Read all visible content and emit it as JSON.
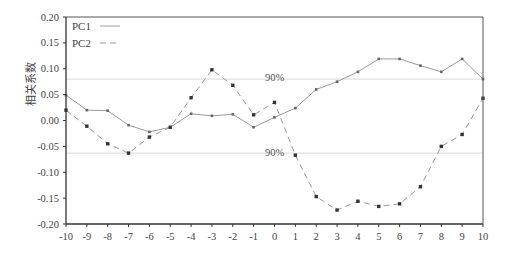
{
  "chart_data": {
    "type": "line",
    "title": "",
    "xlabel": "",
    "ylabel": "相关系数",
    "xlim": [
      -10,
      10
    ],
    "ylim": [
      -0.2,
      0.2
    ],
    "x": [
      -10,
      -9,
      -8,
      -7,
      -6,
      -5,
      -4,
      -3,
      -2,
      -1,
      0,
      1,
      2,
      3,
      4,
      5,
      6,
      7,
      8,
      9,
      10
    ],
    "x_ticks": [
      "-10",
      "-9",
      "-8",
      "-7",
      "-6",
      "-5",
      "-4",
      "-3",
      "-2",
      "-1",
      "0",
      "1",
      "2",
      "3",
      "4",
      "5",
      "6",
      "7",
      "8",
      "9",
      "10"
    ],
    "y_ticks": [
      "0.20",
      "0.15",
      "0.10",
      "0.05",
      "0.00",
      "-0.05",
      "-0.10",
      "-0.15",
      "-0.20"
    ],
    "y_tick_values": [
      0.2,
      0.15,
      0.1,
      0.05,
      0.0,
      -0.05,
      -0.1,
      -0.15,
      -0.2
    ],
    "series": [
      {
        "name": "PC1",
        "style": "solid",
        "color": "#888888",
        "values": [
          0.049,
          0.02,
          0.019,
          -0.009,
          -0.022,
          -0.013,
          0.013,
          0.009,
          0.012,
          -0.013,
          0.006,
          0.024,
          0.06,
          0.075,
          0.094,
          0.119,
          0.119,
          0.106,
          0.094,
          0.119,
          0.08
        ]
      },
      {
        "name": "PC2",
        "style": "dashed",
        "color": "#888888",
        "values": [
          0.02,
          -0.011,
          -0.045,
          -0.063,
          -0.032,
          -0.013,
          0.044,
          0.098,
          0.068,
          0.011,
          0.035,
          -0.067,
          -0.147,
          -0.173,
          -0.156,
          -0.166,
          -0.161,
          -0.128,
          -0.05,
          -0.027,
          0.043
        ]
      }
    ],
    "reference_lines": [
      {
        "label": "90%",
        "value": 0.08
      },
      {
        "label": "90%",
        "value": -0.063
      }
    ],
    "legend": {
      "position": "top-left",
      "entries": [
        "PC1",
        "PC2"
      ]
    },
    "grid": false
  },
  "labels": {
    "ylabel": "相关系数",
    "upper_threshold": "90%",
    "lower_threshold": "90%"
  }
}
